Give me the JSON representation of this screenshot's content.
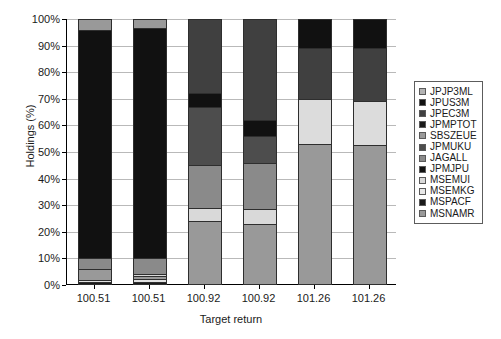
{
  "chart_data": {
    "type": "bar",
    "title": "",
    "subtitle": "",
    "xlabel": "Target return",
    "ylabel": "Holdings (%)",
    "stacked": true,
    "stack_mode": "percent",
    "grid": true,
    "legend_position": "right",
    "ylim": [
      0,
      100
    ],
    "ytick_labels": [
      "0%",
      "10%",
      "20%",
      "30%",
      "40%",
      "50%",
      "60%",
      "70%",
      "80%",
      "90%",
      "100%"
    ],
    "ytick_values": [
      0,
      10,
      20,
      30,
      40,
      50,
      60,
      70,
      80,
      90,
      100
    ],
    "categories": [
      "100.51",
      "100.51",
      "100.92",
      "100.92",
      "101.26",
      "101.26"
    ],
    "series": [
      {
        "name": "JPJP3ML",
        "color": "#b3b3b3",
        "values": [
          0.0,
          0.0,
          0.0,
          0.0,
          0.0,
          0.0
        ]
      },
      {
        "name": "JPUS3M",
        "color": "#111111",
        "values": [
          0.0,
          0.0,
          0.0,
          0.0,
          11.0,
          11.0
        ]
      },
      {
        "name": "JPEC3M",
        "color": "#404040",
        "values": [
          0.0,
          0.0,
          28.0,
          28.0,
          19.0,
          19.5
        ]
      },
      {
        "name": "JPMPTOT",
        "color": "#111111",
        "values": [
          0.0,
          0.0,
          5.0,
          6.0,
          0.0,
          0.0
        ]
      },
      {
        "name": "SBSZEUE",
        "color": "#9a9a9a",
        "values": [
          0.0,
          0.0,
          0.0,
          0.0,
          0.0,
          0.0
        ]
      },
      {
        "name": "JPMUKU",
        "color": "#4d4d4d",
        "values": [
          0.0,
          0.0,
          22.0,
          10.0,
          0.0,
          0.0
        ]
      },
      {
        "name": "JAGALL",
        "color": "#8a8a8a",
        "values": [
          4.0,
          3.5,
          16.0,
          20.5,
          17.0,
          16.5
        ]
      },
      {
        "name": "JPMJPU",
        "color": "#111111",
        "values": [
          86.0,
          86.5,
          0.0,
          0.0,
          0.0,
          0.0
        ]
      },
      {
        "name": "MSEMUI",
        "color": "#d9d9d9",
        "values": [
          0.0,
          0.0,
          5.0,
          5.5,
          0.0,
          0.0
        ]
      },
      {
        "name": "MSEMKG",
        "color": "#e2e2e2",
        "values": [
          1.0,
          1.2,
          0.0,
          0.0,
          0.0,
          0.0
        ]
      },
      {
        "name": "MSPACF",
        "color": "#1a1a1a",
        "values": [
          1.0,
          1.3,
          0.0,
          0.0,
          0.0,
          0.0
        ]
      },
      {
        "name": "MSNAMR",
        "color": "#999999",
        "values": [
          8.0,
          7.5,
          24.0,
          30.0,
          53.0,
          53.0
        ]
      }
    ],
    "bars": [
      {
        "category": "100.51",
        "segments": [
          {
            "name": "MSPACF",
            "from": 0.0,
            "to": 1.0,
            "color": "#1a1a1a"
          },
          {
            "name": "MSEMKG",
            "from": 1.0,
            "to": 2.0,
            "color": "#e2e2e2"
          },
          {
            "name": "MSNAMR",
            "from": 2.0,
            "to": 6.0,
            "color": "#999999"
          },
          {
            "name": "JAGALL",
            "from": 6.0,
            "to": 10.0,
            "color": "#8a8a8a"
          },
          {
            "name": "JPMJPU",
            "from": 10.0,
            "to": 96.0,
            "color": "#111111"
          },
          {
            "name": "MSNAMR",
            "from": 96.0,
            "to": 100.0,
            "color": "#999999"
          }
        ]
      },
      {
        "category": "100.51",
        "segments": [
          {
            "name": "MSPACF",
            "from": 0.0,
            "to": 1.2,
            "color": "#1a1a1a"
          },
          {
            "name": "MSEMKG",
            "from": 1.2,
            "to": 2.2,
            "color": "#e2e2e2"
          },
          {
            "name": "MSNAMR",
            "from": 2.2,
            "to": 3.4,
            "color": "#999999"
          },
          {
            "name": "MSEMUI",
            "from": 3.4,
            "to": 4.2,
            "color": "#d9d9d9"
          },
          {
            "name": "JAGALL",
            "from": 4.2,
            "to": 10.0,
            "color": "#8a8a8a"
          },
          {
            "name": "JPMJPU",
            "from": 10.0,
            "to": 96.5,
            "color": "#111111"
          },
          {
            "name": "MSNAMR",
            "from": 96.5,
            "to": 100.0,
            "color": "#999999"
          }
        ]
      },
      {
        "category": "100.92",
        "segments": [
          {
            "name": "MSNAMR",
            "from": 0.0,
            "to": 24.0,
            "color": "#999999"
          },
          {
            "name": "MSEMUI",
            "from": 24.0,
            "to": 29.0,
            "color": "#d9d9d9"
          },
          {
            "name": "JAGALL",
            "from": 29.0,
            "to": 45.0,
            "color": "#8a8a8a"
          },
          {
            "name": "JPMUKU",
            "from": 45.0,
            "to": 67.0,
            "color": "#4d4d4d"
          },
          {
            "name": "JPMPTOT",
            "from": 67.0,
            "to": 72.0,
            "color": "#111111"
          },
          {
            "name": "JPEC3M",
            "from": 72.0,
            "to": 100.0,
            "color": "#404040"
          }
        ]
      },
      {
        "category": "100.92",
        "segments": [
          {
            "name": "MSNAMR",
            "from": 0.0,
            "to": 23.0,
            "color": "#999999"
          },
          {
            "name": "MSEMUI",
            "from": 23.0,
            "to": 28.5,
            "color": "#d9d9d9"
          },
          {
            "name": "JAGALL",
            "from": 28.5,
            "to": 46.0,
            "color": "#8a8a8a"
          },
          {
            "name": "JPMUKU",
            "from": 46.0,
            "to": 56.0,
            "color": "#4d4d4d"
          },
          {
            "name": "JPMPTOT",
            "from": 56.0,
            "to": 62.0,
            "color": "#111111"
          },
          {
            "name": "JPEC3M",
            "from": 62.0,
            "to": 100.0,
            "color": "#404040"
          }
        ]
      },
      {
        "category": "101.26",
        "segments": [
          {
            "name": "MSNAMR",
            "from": 0.0,
            "to": 53.0,
            "color": "#999999"
          },
          {
            "name": "JAGALL",
            "from": 53.0,
            "to": 70.0,
            "color": "#dcdcdc"
          },
          {
            "name": "JPEC3M",
            "from": 70.0,
            "to": 89.0,
            "color": "#404040"
          },
          {
            "name": "JPUS3M",
            "from": 89.0,
            "to": 100.0,
            "color": "#111111"
          }
        ]
      },
      {
        "category": "101.26",
        "segments": [
          {
            "name": "MSNAMR",
            "from": 0.0,
            "to": 52.5,
            "color": "#999999"
          },
          {
            "name": "JAGALL",
            "from": 52.5,
            "to": 69.0,
            "color": "#dcdcdc"
          },
          {
            "name": "JPEC3M",
            "from": 69.0,
            "to": 89.0,
            "color": "#404040"
          },
          {
            "name": "JPUS3M",
            "from": 89.0,
            "to": 100.0,
            "color": "#111111"
          }
        ]
      }
    ]
  },
  "legend": {
    "items": [
      {
        "label": "JPJP3ML",
        "color": "#b3b3b3"
      },
      {
        "label": "JPUS3M",
        "color": "#111111"
      },
      {
        "label": "JPEC3M",
        "color": "#404040"
      },
      {
        "label": "JPMPTOT",
        "color": "#1a1a1a"
      },
      {
        "label": "SBSZEUE",
        "color": "#9a9a9a"
      },
      {
        "label": "JPMUKU",
        "color": "#4d4d4d"
      },
      {
        "label": "JAGALL",
        "color": "#8a8a8a"
      },
      {
        "label": "JPMJPU",
        "color": "#111111"
      },
      {
        "label": "MSEMUI",
        "color": "#d9d9d9"
      },
      {
        "label": "MSEMKG",
        "color": "#e8e8e8"
      },
      {
        "label": "MSPACF",
        "color": "#1a1a1a"
      },
      {
        "label": "MSNAMR",
        "color": "#999999"
      }
    ]
  }
}
